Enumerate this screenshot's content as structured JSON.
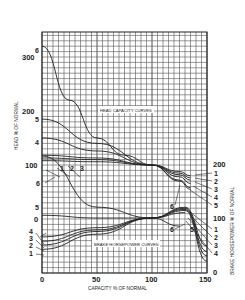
{
  "chart_data": {
    "type": "line",
    "title": "",
    "xlabel": "CAPACITY % OF NORMAL",
    "ylabel_left": "HEAD % OF NORMAL",
    "ylabel_right": "BRAKE HORSEPOWER % OF NORMAL",
    "x_ticks": [
      "0",
      "50",
      "100",
      "150"
    ],
    "y_left_ticks": [
      "100",
      "200",
      "300"
    ],
    "y_right_ticks": [
      "0",
      "100",
      "200"
    ],
    "xlim": [
      0,
      150
    ],
    "ylim_left": [
      -100,
      345
    ],
    "ylim_right": [
      0,
      400
    ],
    "grid": true,
    "annotations": [
      "HEAD CAPACITY CURVES",
      "BRAKE HORSEPOWER CURVES"
    ],
    "head_curves": [
      {
        "name": "1",
        "x": [
          0,
          50,
          100,
          125,
          135
        ],
        "y": [
          108,
          106,
          100,
          88,
          80
        ]
      },
      {
        "name": "2",
        "x": [
          0,
          50,
          100,
          125,
          135
        ],
        "y": [
          113,
          110,
          100,
          85,
          76
        ]
      },
      {
        "name": "3",
        "x": [
          0,
          50,
          100,
          125,
          135
        ],
        "y": [
          118,
          113,
          100,
          82,
          72
        ]
      },
      {
        "name": "4",
        "x": [
          0,
          50,
          100,
          125,
          135
        ],
        "y": [
          150,
          126,
          100,
          78,
          66
        ]
      },
      {
        "name": "5",
        "x": [
          0,
          50,
          100,
          125,
          135
        ],
        "y": [
          185,
          140,
          100,
          72,
          58
        ]
      },
      {
        "name": "6",
        "x": [
          0,
          25,
          50,
          75,
          100,
          125,
          135
        ],
        "y": [
          320,
          220,
          150,
          118,
          100,
          70,
          55
        ]
      }
    ],
    "bhp_curves": [
      {
        "name": "1",
        "x": [
          0,
          50,
          100,
          130,
          150
        ],
        "y": [
          42,
          70,
          100,
          120,
          48
        ]
      },
      {
        "name": "2",
        "x": [
          0,
          50,
          100,
          130,
          150
        ],
        "y": [
          50,
          75,
          100,
          118,
          38
        ]
      },
      {
        "name": "3",
        "x": [
          0,
          50,
          100,
          130,
          150
        ],
        "y": [
          57,
          78,
          100,
          116,
          30
        ]
      },
      {
        "name": "4",
        "x": [
          0,
          50,
          100,
          130,
          150
        ],
        "y": [
          65,
          82,
          100,
          114,
          20
        ]
      },
      {
        "name": "5",
        "x": [
          0,
          50,
          100,
          130
        ],
        "y": [
          105,
          100,
          100,
          110
        ]
      },
      {
        "name": "6",
        "x": [
          0,
          50,
          100,
          125
        ],
        "y": [
          215,
          120,
          100,
          85
        ]
      }
    ]
  },
  "labels": {
    "xlabel": "CAPACITY % OF NORMAL",
    "ylabel_left": "HEAD % OF NORMAL",
    "ylabel_right": "BRAKE HORSEPOWER % OF NORMAL",
    "head_annotation": "HEAD CAPACITY CURVES",
    "bhp_annotation": "BRAKE HORSEPOWER CURVES",
    "x_tick_0": "0",
    "x_tick_50": "50",
    "x_tick_100": "100",
    "x_tick_150": "150",
    "left_tick_300": "300",
    "left_tick_200": "200",
    "left_tick_100": "100",
    "left_tick_0": "0",
    "right_tick_200": "200",
    "right_tick_100": "100",
    "right_tick_0": "0",
    "curve_1": "1",
    "curve_2": "2",
    "curve_3": "3",
    "curve_4": "4",
    "curve_5": "5",
    "curve_6": "6"
  }
}
